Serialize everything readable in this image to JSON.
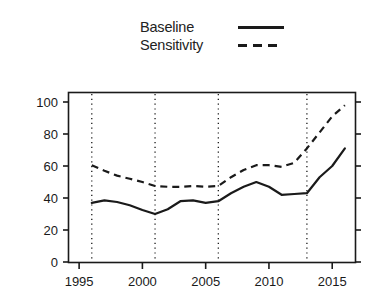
{
  "chart_data": {
    "type": "line",
    "title": "",
    "subtitle": "",
    "xlabel": "",
    "ylabel": "",
    "xlim": [
      1994.2,
      2016.8
    ],
    "ylim": [
      0,
      105
    ],
    "grid": false,
    "legend_position": "top-center",
    "x": [
      1996,
      1997,
      1998,
      1999,
      2000,
      2001,
      2002,
      2003,
      2004,
      2005,
      2006,
      2007,
      2008,
      2009,
      2010,
      2011,
      2012,
      2013,
      2014,
      2015,
      2016
    ],
    "xticks": [
      1995,
      2000,
      2005,
      2010,
      2015
    ],
    "xtick_labels": [
      "1995",
      "2000",
      "2005",
      "2010",
      "2015"
    ],
    "yticks": [
      0,
      20,
      40,
      60,
      80,
      100
    ],
    "ytick_labels": [
      "0",
      "20",
      "40",
      "60",
      "80",
      "100"
    ],
    "vertical_reference_lines": [
      1996,
      2001,
      2006,
      2013
    ],
    "series": [
      {
        "name": "Baseline",
        "style": "solid",
        "color": "#1a1a1a",
        "values": [
          37,
          38.5,
          37.5,
          35.5,
          32.5,
          30,
          33,
          38,
          38.5,
          37,
          38,
          43,
          47,
          50,
          47,
          42,
          42.5,
          43,
          53,
          60,
          71
        ]
      },
      {
        "name": "Sensitivity",
        "style": "dashed",
        "color": "#1a1a1a",
        "values": [
          60.5,
          57,
          54,
          52,
          50,
          47.5,
          47,
          47,
          47.5,
          47,
          47.5,
          53,
          57.5,
          60.5,
          60.5,
          59.5,
          62,
          71,
          81,
          91,
          98
        ]
      }
    ]
  },
  "legend": {
    "items": [
      {
        "label": "Baseline",
        "style": "solid"
      },
      {
        "label": "Sensitivity",
        "style": "dashed"
      }
    ]
  }
}
